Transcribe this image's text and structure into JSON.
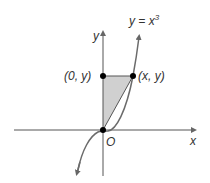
{
  "diagram": {
    "curve_label": "y = x",
    "curve_exponent": "3",
    "x_axis_label": "x",
    "y_axis_label": "y",
    "origin_label": "O",
    "point_on_axis_label": "(0, y)",
    "point_on_curve_label": "(x, y)",
    "colors": {
      "axis": "#555555",
      "curve": "#6b6b6b",
      "shade": "#d0d0d0",
      "point": "#000000"
    }
  }
}
